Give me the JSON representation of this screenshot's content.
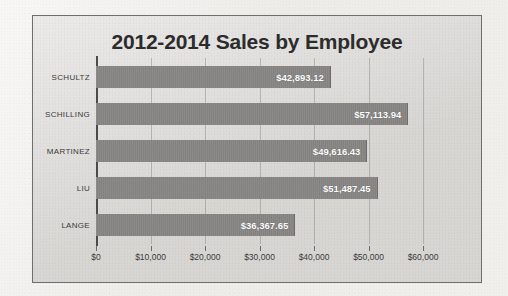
{
  "chart_data": {
    "type": "bar",
    "orientation": "horizontal",
    "title": "2012-2014 Sales by Employee",
    "categories": [
      "SCHULTZ",
      "SCHILLING",
      "MARTINEZ",
      "LIU",
      "LANGE"
    ],
    "values": [
      42893.12,
      57113.94,
      49616.43,
      51487.45,
      36367.65
    ],
    "data_labels": [
      "$42,893.12",
      "$57,113.94",
      "$49,616.43",
      "$51,487.45",
      "$36,367.65"
    ],
    "xlabel": "",
    "ylabel": "",
    "xlim": [
      0,
      60000
    ],
    "xticks": [
      0,
      10000,
      20000,
      30000,
      40000,
      50000,
      60000
    ],
    "xtick_labels": [
      "$0",
      "$10,000",
      "$20,000",
      "$30,000",
      "$40,000",
      "$50,000",
      "$60,000"
    ],
    "grid": true,
    "grid_axis": "x",
    "legend": false,
    "series": [
      {
        "name": "Sales",
        "values": [
          42893.12,
          57113.94,
          49616.43,
          51487.45,
          36367.65
        ]
      }
    ],
    "colors": {
      "bar": "#868584",
      "plot_background": "#d8d6d3",
      "frame_border": "#6e6e6e",
      "axis_line": "#4a4a4a",
      "title_text": "#2b2b2b",
      "label_text": "#3a3a3a",
      "data_label_text": "#ffffff"
    }
  }
}
